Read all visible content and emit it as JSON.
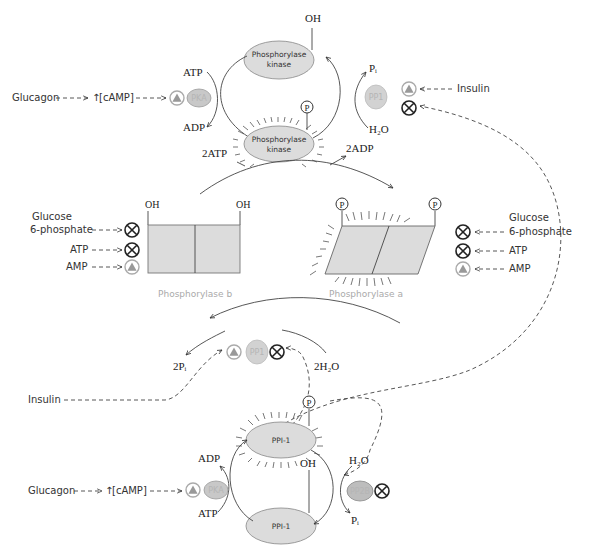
{
  "colors": {
    "enzyme_fill": "#dcdcdc",
    "enzyme_stroke": "#888888",
    "activator_fill": "#aaaaaa",
    "caption_gray": "#aaaaaa",
    "line": "#444444"
  },
  "top_cycle": {
    "enzyme_inactive": {
      "line1": "Phosphorylase",
      "line2": "kinase",
      "group": "OH"
    },
    "enzyme_active": {
      "line1": "Phosphorylase",
      "line2": "kinase",
      "group": "P"
    },
    "left_in": "ATP",
    "left_out": "ADP",
    "right_in": "H₂O",
    "right_out": "Pᵢ",
    "kinase": "PKA",
    "phosphatase": "PP1",
    "hormone_left": "Glucagon",
    "second_messenger": "[cAMP]",
    "hormone_right": "Insulin"
  },
  "middle_cycle": {
    "left_in": "2ATP",
    "right_out": "2ADP",
    "left_out": "2Pᵢ",
    "right_in": "2H₂O",
    "phosphatase": "PP1",
    "phosphorylase_b": {
      "caption": "Phosphorylase b",
      "groups": [
        "OH",
        "OH"
      ]
    },
    "phosphorylase_a": {
      "caption": "Phosphorylase a",
      "groups": [
        "P",
        "P"
      ]
    },
    "left_regulators": [
      {
        "line1": "Glucose",
        "line2": "6-phosphate",
        "effect": "inhibit"
      },
      {
        "line1": "ATP",
        "line2": "",
        "effect": "inhibit"
      },
      {
        "line1": "AMP",
        "line2": "",
        "effect": "activate"
      }
    ],
    "right_regulators": [
      {
        "line1": "Glucose",
        "line2": "6-phosphate",
        "effect": "inhibit"
      },
      {
        "line1": "ATP",
        "line2": "",
        "effect": "inhibit"
      },
      {
        "line1": "AMP",
        "line2": "",
        "effect": "activate"
      }
    ],
    "insulin": "Insulin"
  },
  "bottom_cycle": {
    "enzyme_active": {
      "label": "PPI-1",
      "group": "P"
    },
    "enzyme_inactive": {
      "label": "PPI-1",
      "group": "OH"
    },
    "left_out": "ADP",
    "left_in": "ATP",
    "right_in": "H₂O",
    "right_out": "Pᵢ",
    "kinase": "PKA",
    "phosphatase": "PP2B",
    "hormone": "Glucagon",
    "second_messenger": "[cAMP]"
  }
}
